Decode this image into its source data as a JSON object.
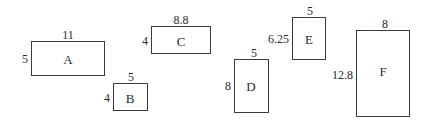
{
  "diagram": {
    "type": "rectangles",
    "shapes": [
      {
        "name": "A",
        "width": "11",
        "height": "5"
      },
      {
        "name": "B",
        "width": "5",
        "height": "4"
      },
      {
        "name": "C",
        "width": "8.8",
        "height": "4"
      },
      {
        "name": "D",
        "width": "5",
        "height": "8"
      },
      {
        "name": "E",
        "width": "5",
        "height": "6.25"
      },
      {
        "name": "F",
        "width": "8",
        "height": "12.8"
      }
    ]
  }
}
